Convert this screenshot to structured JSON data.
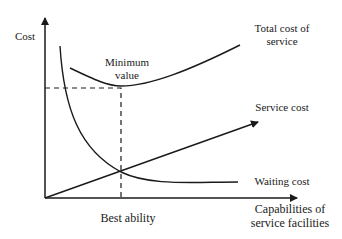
{
  "diagram": {
    "type": "cost-capacity tradeoff",
    "y_axis_label": "Cost",
    "x_axis_label_line1": "Capabilities of",
    "x_axis_label_line2": "service facilities",
    "curves": {
      "total_cost_line1": "Total cost of",
      "total_cost_line2": "service",
      "service_cost": "Service cost",
      "waiting_cost": "Waiting cost"
    },
    "annotations": {
      "minimum_line1": "Minimum",
      "minimum_line2": "value",
      "best_ability": "Best ability"
    },
    "colors": {
      "line": "#1a1a1a",
      "background": "#ffffff"
    }
  }
}
